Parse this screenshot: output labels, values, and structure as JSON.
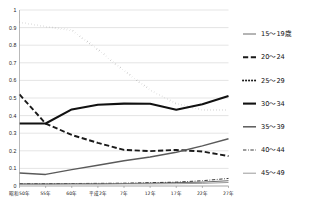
{
  "chart_data": {
    "type": "line",
    "title": "",
    "xlabel": "",
    "ylabel": "",
    "ylim": [
      0,
      1
    ],
    "ytick_labels": [
      "1",
      "0.9",
      "0.8",
      "0.7",
      "0.6",
      "0.5",
      "0.4",
      "0.3",
      "0.2",
      "0.1",
      "0"
    ],
    "ytick_values": [
      1,
      0.9,
      0.8,
      0.7,
      0.6,
      0.5,
      0.4,
      0.3,
      0.2,
      0.1,
      0
    ],
    "grid": true,
    "legend_position": "right",
    "categories": [
      "昭和50年",
      "55年",
      "60年",
      "平成2年",
      "7年",
      "12年",
      "17年",
      "22年",
      "27年"
    ],
    "series": [
      {
        "name": "15〜19歳",
        "style": "solid-thin",
        "color": "#6b6b6b",
        "values": [
          0.012,
          0.012,
          0.013,
          0.013,
          0.014,
          0.016,
          0.019,
          0.022,
          0.03
        ]
      },
      {
        "name": "20〜24",
        "style": "dashed",
        "color": "#1a1a1a",
        "values": [
          0.52,
          0.355,
          0.29,
          0.245,
          0.205,
          0.198,
          0.205,
          0.196,
          0.17
        ]
      },
      {
        "name": "25〜29",
        "style": "dotted",
        "color": "#1a1a1a",
        "values": [
          0.93,
          0.905,
          0.885,
          0.775,
          0.655,
          0.545,
          0.468,
          0.432,
          0.432
        ]
      },
      {
        "name": "30〜34",
        "style": "solid-thick",
        "color": "#111111",
        "values": [
          0.355,
          0.355,
          0.435,
          0.462,
          0.468,
          0.467,
          0.433,
          0.465,
          0.512
        ]
      },
      {
        "name": "35〜39",
        "style": "solid-medium",
        "color": "#5a5a5a",
        "values": [
          0.074,
          0.066,
          0.093,
          0.118,
          0.143,
          0.165,
          0.192,
          0.228,
          0.268
        ]
      },
      {
        "name": "40〜44",
        "style": "dash-dot",
        "color": "#3a3a3a",
        "values": [
          0.013,
          0.013,
          0.014,
          0.015,
          0.016,
          0.019,
          0.022,
          0.03,
          0.043
        ]
      },
      {
        "name": "45〜49",
        "style": "solid-thin-light",
        "color": "#8f8f8f",
        "values": [
          0.01,
          0.01,
          0.011,
          0.011,
          0.012,
          0.012,
          0.013,
          0.015,
          0.02
        ]
      }
    ]
  },
  "legend": {
    "items": [
      {
        "label": "15〜19歳"
      },
      {
        "label": "20〜24"
      },
      {
        "label": "25〜29"
      },
      {
        "label": "30〜34"
      },
      {
        "label": "35〜39"
      },
      {
        "label": "40〜44"
      },
      {
        "label": "45〜49"
      }
    ]
  }
}
